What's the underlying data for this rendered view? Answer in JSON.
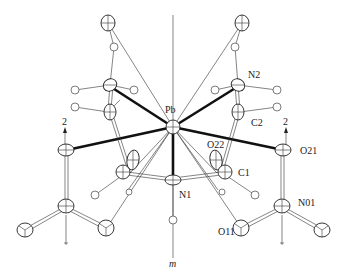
{
  "figure": {
    "type": "ORTEP crystal structure diagram",
    "mirror_label": "m",
    "axis_label": "2",
    "atom_labels": {
      "pb": "Pb",
      "n1": "N1",
      "n2": "N2",
      "c1": "C1",
      "c2": "C2",
      "o21": "O21",
      "o22": "O22",
      "o11": "O11",
      "n01": "N01"
    }
  }
}
